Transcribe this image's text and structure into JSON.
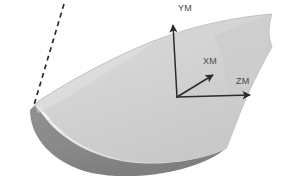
{
  "figure": {
    "background_color": "#ffffff",
    "width": 284,
    "height": 176,
    "surface": {
      "name": "curved-shell-surface",
      "top_face_color": "#d6d6d6",
      "top_face_shade_color": "#cacaca",
      "underside_color": "#8a8a8a",
      "underside_shadow_color": "#7d7d7d",
      "edge_band_color": "#f2f2f2",
      "hatch_line_color": "#b4b4b4",
      "outline_color": "#bdbdbd"
    },
    "dashed_line": {
      "name": "reference-dashed-line",
      "color": "#2d2d2d",
      "dash_pattern": "5 4",
      "stroke_width": 1.7,
      "x1": 64,
      "y1": 4,
      "x2": 34,
      "y2": 105
    },
    "axes": {
      "name": "coordinate-axis-triad",
      "color": "#2b2b2b",
      "origin": {
        "x": 177,
        "y": 97
      },
      "items": [
        {
          "name": "axis-y",
          "label": "YM",
          "tip": {
            "x": 171,
            "y": 18
          },
          "label_x": 178,
          "label_y": 11
        },
        {
          "name": "axis-x",
          "label": "XM",
          "tip": {
            "x": 216,
            "y": 73
          },
          "label_x": 205,
          "label_y": 64
        },
        {
          "name": "axis-z",
          "label": "ZM",
          "tip": {
            "x": 253,
            "y": 95
          },
          "label_x": 238,
          "label_y": 84
        }
      ]
    }
  }
}
